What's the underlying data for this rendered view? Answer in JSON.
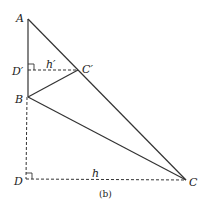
{
  "diagram": {
    "caption": "(b)",
    "points": {
      "A": {
        "label": "A",
        "x": 28,
        "y": 19
      },
      "Dp": {
        "label": "D′",
        "x": 28,
        "y": 70
      },
      "Cp": {
        "label": "C′",
        "x": 78,
        "y": 70
      },
      "B": {
        "label": "B",
        "x": 28,
        "y": 97
      },
      "D": {
        "label": "D",
        "x": 26,
        "y": 179
      },
      "C": {
        "label": "C",
        "x": 186,
        "y": 180
      }
    },
    "segments_solid": [
      "A-B",
      "A-C",
      "B-C",
      "B-C′"
    ],
    "segments_dashed": [
      "D′-C′",
      "B-D",
      "D-C"
    ],
    "right_angles": [
      "D′",
      "D"
    ],
    "heights": {
      "h_prime": "h′",
      "h": "h"
    },
    "colors": {
      "line": "#333333",
      "background": "#ffffff"
    }
  }
}
